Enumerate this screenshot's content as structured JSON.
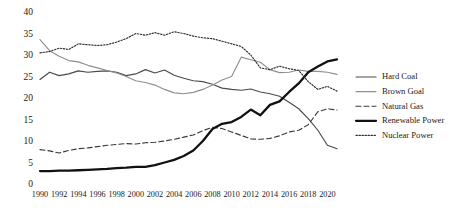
{
  "chart_data": {
    "type": "line",
    "title": "",
    "xlabel": "",
    "ylabel": "",
    "grid": false,
    "legend_position": "right",
    "xlim": [
      1990,
      2021
    ],
    "ylim": [
      0,
      40
    ],
    "yticks": [
      0,
      5,
      10,
      15,
      20,
      25,
      30,
      35,
      40
    ],
    "xticks": [
      1990,
      1992,
      1994,
      1996,
      1998,
      2000,
      2002,
      2004,
      2006,
      2008,
      2010,
      2012,
      2014,
      2016,
      2018,
      2020
    ],
    "x": [
      1990,
      1991,
      1992,
      1993,
      1994,
      1995,
      1996,
      1997,
      1998,
      1999,
      2000,
      2001,
      2002,
      2003,
      2004,
      2005,
      2006,
      2007,
      2008,
      2009,
      2010,
      2011,
      2012,
      2013,
      2014,
      2015,
      2016,
      2017,
      2018,
      2019,
      2020,
      2021
    ],
    "series": [
      {
        "name": "Hard Coal",
        "style": "solid-dark",
        "color": "#4a4a4a",
        "values": [
          24.3,
          26.0,
          25.2,
          25.6,
          26.3,
          26.0,
          26.2,
          26.3,
          26.0,
          25.2,
          25.6,
          26.6,
          25.8,
          26.5,
          25.3,
          24.6,
          24.0,
          23.8,
          23.2,
          22.3,
          22.0,
          21.8,
          22.1,
          21.4,
          21.0,
          20.4,
          19.0,
          17.5,
          15.2,
          12.5,
          9.0,
          8.2
        ]
      },
      {
        "name": "Brown Goal",
        "style": "solid-grey",
        "color": "#8f8f8f",
        "values": [
          33.6,
          31.0,
          29.7,
          28.7,
          28.4,
          27.6,
          27.0,
          26.4,
          25.8,
          25.0,
          24.0,
          23.6,
          23.0,
          22.0,
          21.2,
          21.0,
          21.3,
          22.0,
          23.0,
          24.2,
          25.0,
          29.5,
          28.9,
          28.3,
          26.6,
          25.9,
          26.0,
          26.5,
          26.2,
          26.2,
          26.0,
          25.5
        ]
      },
      {
        "name": "Natural Gas",
        "style": "dashed",
        "color": "#3a3a3a",
        "values": [
          8.0,
          7.7,
          7.2,
          7.8,
          8.2,
          8.4,
          8.7,
          9.0,
          9.2,
          9.4,
          9.3,
          9.6,
          9.7,
          10.0,
          10.4,
          10.9,
          11.4,
          12.4,
          13.2,
          12.9,
          12.1,
          11.3,
          10.5,
          10.4,
          10.6,
          11.2,
          12.1,
          12.5,
          13.8,
          16.8,
          17.5,
          17.2
        ]
      },
      {
        "name": "Renewable Power",
        "style": "solid-thick",
        "color": "#111111",
        "values": [
          3.0,
          3.0,
          3.1,
          3.1,
          3.2,
          3.3,
          3.4,
          3.5,
          3.7,
          3.8,
          4.0,
          4.0,
          4.4,
          5.0,
          5.6,
          6.5,
          7.8,
          10.0,
          12.8,
          14.0,
          14.4,
          15.6,
          17.3,
          16.0,
          18.4,
          19.2,
          21.4,
          23.4,
          26.0,
          27.3,
          28.5,
          29.0
        ]
      },
      {
        "name": "Nuclear Power",
        "style": "dotted",
        "color": "#2e2e2e",
        "values": [
          30.5,
          30.8,
          31.6,
          31.3,
          32.6,
          32.4,
          32.2,
          32.4,
          33.0,
          33.8,
          35.0,
          34.6,
          35.2,
          34.6,
          35.4,
          35.0,
          34.4,
          34.0,
          33.8,
          33.2,
          32.6,
          32.0,
          30.0,
          27.0,
          26.6,
          27.4,
          26.8,
          26.4,
          23.8,
          22.0,
          22.7,
          21.6
        ]
      }
    ]
  },
  "axis": {
    "y_labels": [
      "40",
      "35",
      "30",
      "25",
      "20",
      "15",
      "10",
      "5",
      "0"
    ],
    "x_labels": [
      "1990",
      "1992",
      "1994",
      "1996",
      "1998",
      "2000",
      "2002",
      "2004",
      "2006",
      "2008",
      "2010",
      "2012",
      "2014",
      "2016",
      "2018",
      "2020"
    ]
  },
  "legend": {
    "items": [
      {
        "label": "Hard Coal",
        "swatch": "line-solid-dark-swatch"
      },
      {
        "label": "Brown Goal",
        "swatch": "line-solid-grey-swatch"
      },
      {
        "label": "Natural Gas",
        "swatch": "line-dashed-swatch"
      },
      {
        "label": "Renewable Power",
        "swatch": "line-solid-thick-swatch"
      },
      {
        "label": "Nuclear Power",
        "swatch": "line-dotted-swatch"
      }
    ]
  }
}
